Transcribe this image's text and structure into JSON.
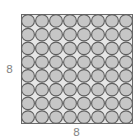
{
  "diagram": {
    "rows": 8,
    "cols": 8,
    "left_label": "8",
    "bottom_label": "8",
    "colors": {
      "background": "#e6e6e6",
      "border": "#6a6a6a",
      "circle_fill": "#c6c6c6",
      "circle_stroke": "#5e5e5e"
    }
  }
}
